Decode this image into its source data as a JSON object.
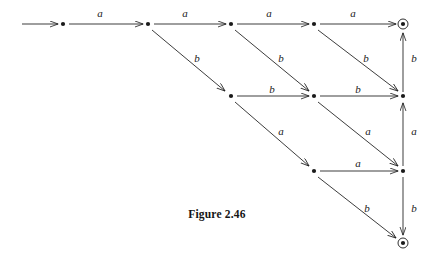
{
  "figure": {
    "caption": "Figure 2.46",
    "type": "state-transition-diagram",
    "alphabet": [
      "a",
      "b"
    ],
    "stroke_color": "#1a1a1a",
    "background_color": "#ffffff"
  },
  "nodes": [
    {
      "id": "q0",
      "label": "",
      "kind": "state",
      "x": 63,
      "y": 24
    },
    {
      "id": "q1",
      "label": "",
      "kind": "state",
      "x": 148,
      "y": 24
    },
    {
      "id": "q2",
      "label": "",
      "kind": "state",
      "x": 231,
      "y": 24
    },
    {
      "id": "q3",
      "label": "",
      "kind": "state",
      "x": 314,
      "y": 24
    },
    {
      "id": "q4",
      "label": "",
      "kind": "accepting",
      "x": 403,
      "y": 24
    },
    {
      "id": "r2",
      "label": "",
      "kind": "state",
      "x": 231,
      "y": 96
    },
    {
      "id": "r3",
      "label": "",
      "kind": "state",
      "x": 314,
      "y": 96
    },
    {
      "id": "r4",
      "label": "",
      "kind": "state",
      "x": 403,
      "y": 96
    },
    {
      "id": "s3",
      "label": "",
      "kind": "state",
      "x": 314,
      "y": 171
    },
    {
      "id": "s4",
      "label": "",
      "kind": "state",
      "x": 403,
      "y": 171
    },
    {
      "id": "t4",
      "label": "",
      "kind": "accepting",
      "x": 403,
      "y": 243
    }
  ],
  "start_arrow": {
    "from_x": 22,
    "to_x": 58,
    "y": 24
  },
  "edges": [
    {
      "from": "q0",
      "to": "q1",
      "symbol": "a",
      "label_x": 100,
      "label_y": 13
    },
    {
      "from": "q1",
      "to": "q2",
      "symbol": "a",
      "label_x": 185,
      "label_y": 13
    },
    {
      "from": "q2",
      "to": "q3",
      "symbol": "a",
      "label_x": 269,
      "label_y": 13
    },
    {
      "from": "q3",
      "to": "q4",
      "symbol": "a",
      "label_x": 353,
      "label_y": 13
    },
    {
      "from": "q1",
      "to": "r2",
      "symbol": "b",
      "label_x": 197,
      "label_y": 58
    },
    {
      "from": "q2",
      "to": "r3",
      "symbol": "b",
      "label_x": 281,
      "label_y": 58
    },
    {
      "from": "q3",
      "to": "r4",
      "symbol": "b",
      "label_x": 366,
      "label_y": 58
    },
    {
      "from": "q4",
      "to": "r4",
      "symbol": "b",
      "label_x": 412,
      "label_y": 58,
      "direction": "vertical-up"
    },
    {
      "from": "r2",
      "to": "r3",
      "symbol": "b",
      "label_x": 272,
      "label_y": 89
    },
    {
      "from": "r3",
      "to": "r4",
      "symbol": "b",
      "label_x": 358,
      "label_y": 89
    },
    {
      "from": "r2",
      "to": "s3",
      "symbol": "a",
      "label_x": 281,
      "label_y": 131
    },
    {
      "from": "r3",
      "to": "s4",
      "symbol": "a",
      "label_x": 368,
      "label_y": 131
    },
    {
      "from": "r4",
      "to": "s4",
      "symbol": "a",
      "label_x": 412,
      "label_y": 131,
      "direction": "vertical-up"
    },
    {
      "from": "s3",
      "to": "s4",
      "symbol": "a",
      "label_x": 358,
      "label_y": 163
    },
    {
      "from": "s3",
      "to": "t4",
      "symbol": "b",
      "label_x": 367,
      "label_y": 208
    },
    {
      "from": "s4",
      "to": "t4",
      "symbol": "b",
      "label_x": 412,
      "label_y": 208,
      "direction": "vertical-down"
    }
  ]
}
